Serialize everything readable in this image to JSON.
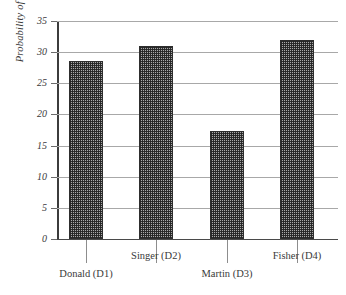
{
  "chart_data": {
    "type": "bar",
    "title": "",
    "xlabel": "",
    "ylabel": "Probability of Support",
    "categories": [
      "Donald (D1)",
      "Singer (D2)",
      "Martin (D3)",
      "Fisher (D4)"
    ],
    "values": [
      28.5,
      31.0,
      17.3,
      32.0
    ],
    "ylim": [
      0,
      35
    ],
    "yticks": [
      0,
      5,
      10,
      15,
      20,
      25,
      30,
      35
    ],
    "ytick_labels": [
      "0",
      "5",
      "10",
      "15",
      "20",
      "25",
      "30",
      "35"
    ],
    "grid": true,
    "legend": null,
    "bar_fill": "crosshatch",
    "colors": {
      "bar_fill": "#a9a9a9",
      "bar_edge": "#2e2e2e",
      "gridline": "#a8a8a8",
      "axis": "#3c3c3c",
      "text": "#3a3a3a",
      "background": "#ffffff"
    }
  },
  "axis": {
    "y_title": "Probability of Support",
    "ticks": [
      {
        "label": "35",
        "value": 35
      },
      {
        "label": "30",
        "value": 30
      },
      {
        "label": "25",
        "value": 25
      },
      {
        "label": "20",
        "value": 20
      },
      {
        "label": "15",
        "value": 15
      },
      {
        "label": "10",
        "value": 10
      },
      {
        "label": "5",
        "value": 5
      },
      {
        "label": "0",
        "value": 0
      }
    ]
  },
  "bars": [
    {
      "label": "Donald (D1)",
      "value": 28.5,
      "row": "lower"
    },
    {
      "label": "Singer (D2)",
      "value": 31.0,
      "row": "upper"
    },
    {
      "label": "Martin (D3)",
      "value": 17.3,
      "row": "lower"
    },
    {
      "label": "Fisher (D4)",
      "value": 32.0,
      "row": "upper"
    }
  ]
}
